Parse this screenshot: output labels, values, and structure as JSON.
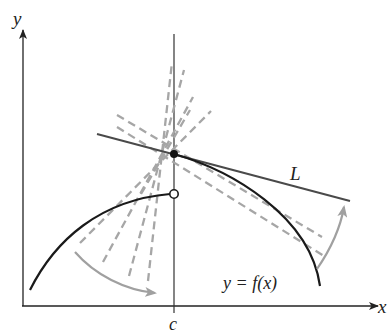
{
  "figure": {
    "type": "tangent-from-right diagram",
    "axes": {
      "x_label": "x",
      "y_label": "y",
      "tick_label": "c"
    },
    "labels": {
      "tangent_line": "L",
      "function": "y = f(x)"
    },
    "points": {
      "filled": "(c, f(c))",
      "open": "left-limit hole at x = c"
    },
    "colors": {
      "curve": "#1a1a1a",
      "tangent_line": "#4a4a4a",
      "secants": "#a6a6a6",
      "arrows": "#a0a0a0",
      "axes": "#222222"
    }
  }
}
